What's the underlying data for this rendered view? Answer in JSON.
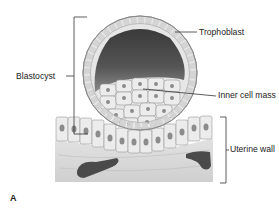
{
  "figure": {
    "panel_letter": "A",
    "labels": {
      "blastocyst": "Blastocyst",
      "trophoblast": "Trophoblast",
      "inner_cell_mass": "Inner cell mass",
      "uterine_wall": "Uterine wall"
    },
    "colors": {
      "cavity_dark": "#3a3a3a",
      "cavity_light": "#8a8a8a",
      "cell_fill": "#ececec",
      "cell_stroke": "#9a9a9a",
      "nucleus": "#8c8c8c",
      "tissue": "#d6d6d6",
      "vessel": "#4a4a4a",
      "line": "#333333",
      "text": "#222222"
    }
  }
}
